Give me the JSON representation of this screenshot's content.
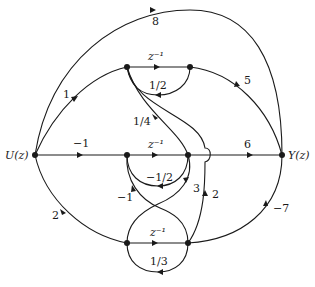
{
  "diagram": {
    "input_label": "U(z)",
    "output_label": "Y(z)",
    "nodes": [
      {
        "id": "U",
        "label": "U(z)"
      },
      {
        "id": "A",
        "label": ""
      },
      {
        "id": "B",
        "label": ""
      },
      {
        "id": "C",
        "label": ""
      },
      {
        "id": "D",
        "label": ""
      },
      {
        "id": "E",
        "label": ""
      },
      {
        "id": "F",
        "label": ""
      },
      {
        "id": "Y",
        "label": "Y(z)"
      }
    ],
    "edges": [
      {
        "from": "U",
        "to": "Y",
        "gain": "8"
      },
      {
        "from": "U",
        "to": "A",
        "gain": "1"
      },
      {
        "from": "A",
        "to": "B",
        "gain": "z⁻¹"
      },
      {
        "from": "B",
        "to": "A",
        "gain": "1/2"
      },
      {
        "from": "B",
        "to": "Y",
        "gain": "5"
      },
      {
        "from": "D",
        "to": "A",
        "gain": "1/4"
      },
      {
        "from": "F",
        "to": "A",
        "gain": "2"
      },
      {
        "from": "U",
        "to": "C",
        "gain": "−1"
      },
      {
        "from": "C",
        "to": "D",
        "gain": "z⁻¹"
      },
      {
        "from": "D",
        "to": "C",
        "gain": "−1/2"
      },
      {
        "from": "D",
        "to": "Y",
        "gain": "6"
      },
      {
        "from": "F",
        "to": "C",
        "gain": "−1"
      },
      {
        "from": "E",
        "to": "D",
        "gain": "3"
      },
      {
        "from": "U",
        "to": "E",
        "gain": "2"
      },
      {
        "from": "E",
        "to": "F",
        "gain": "z⁻¹"
      },
      {
        "from": "F",
        "to": "E",
        "gain": "1/3"
      },
      {
        "from": "F",
        "to": "Y",
        "gain": "−7"
      }
    ]
  }
}
